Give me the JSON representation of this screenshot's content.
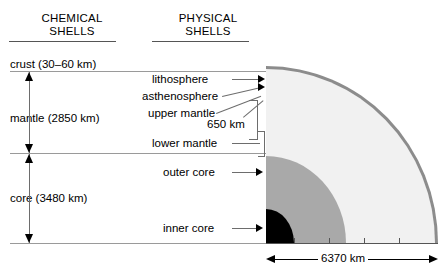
{
  "figure": {
    "headers": {
      "chemical": "CHEMICAL\nSHELLS",
      "physical": "PHYSICAL\nSHELLS"
    }
  },
  "chemical_shells": [
    {
      "label": "crust (30–60 km)",
      "name": "crust",
      "thickness_km": "30–60"
    },
    {
      "label": "mantle (2850 km)",
      "name": "mantle",
      "thickness_km": "2850"
    },
    {
      "label": "core (3480 km)",
      "name": "core",
      "thickness_km": "3480"
    }
  ],
  "physical_shells": [
    {
      "label": "lithosphere"
    },
    {
      "label": "asthenosphere"
    },
    {
      "label": "upper mantle"
    },
    {
      "label": "lower mantle"
    },
    {
      "label": "outer core"
    },
    {
      "label": "inner core"
    }
  ],
  "annotations": {
    "depth_650": "650 km",
    "radius": "6370 km"
  },
  "colors": {
    "crust_rim": "#8c8c8c",
    "mantle": "#f1f1f1",
    "outer_core": "#a9a9a9",
    "inner_core": "#000000",
    "rule": "#9a9a9a",
    "text": "#000000"
  }
}
